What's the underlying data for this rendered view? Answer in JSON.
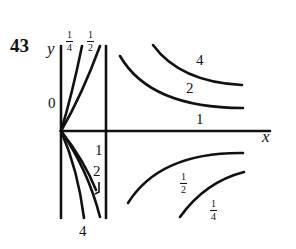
{
  "problem_number": "43",
  "axes": {
    "x_label": "x",
    "y_label": "y"
  },
  "tick_labels": {
    "y_zero": "0",
    "x_one": "1"
  },
  "curve_labels": {
    "left_up_quarter": {
      "num": "1",
      "den": "4"
    },
    "left_up_half": {
      "num": "1",
      "den": "2"
    },
    "left_down_two": "2",
    "left_down_four": "4",
    "horizontal_one": "1",
    "right_upper_four": "4",
    "right_upper_two": "2",
    "right_lower_half": {
      "num": "1",
      "den": "2"
    },
    "right_lower_quarter": {
      "num": "1",
      "den": "4"
    }
  },
  "colors": {
    "ink": "#111111",
    "background": "#ffffff"
  }
}
